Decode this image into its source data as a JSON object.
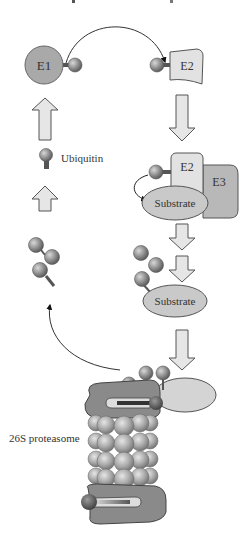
{
  "diagram": {
    "title_clipped": "",
    "nodes": {
      "e1": {
        "label": "E1"
      },
      "e2": {
        "label": "E2"
      },
      "e2_complex": {
        "label": "E2"
      },
      "e3": {
        "label": "E3"
      },
      "substrate_1": {
        "label": "Substrate"
      },
      "substrate_2": {
        "label": "Substrate"
      },
      "ubiquitin_legend": {
        "label": "Ubiquitin"
      },
      "proteasome": {
        "label": "26S proteasome"
      }
    },
    "colors": {
      "e1_fill": "#a9a9a9",
      "e2_fill": "#e2e2e2",
      "e3_fill": "#b8b8b8",
      "substrate_fill": "#c9c9c9",
      "ubiquitin_fill": "#8f8f8f",
      "arrow_fill": "#e6e6e6",
      "proteasome_cap": "#8a8a8a",
      "proteasome_core": "#a5a5a5"
    }
  }
}
